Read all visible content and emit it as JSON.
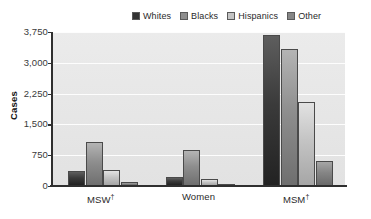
{
  "chart_data": {
    "type": "bar",
    "title": "",
    "xlabel": "",
    "ylabel": "Cases",
    "categories": [
      "MSW†",
      "Women",
      "MSM†"
    ],
    "series": [
      {
        "name": "Whites",
        "color": "#333333",
        "values": [
          370,
          230,
          3680
        ]
      },
      {
        "name": "Blacks",
        "color": "#8e8e8e",
        "values": [
          1080,
          880,
          3330
        ]
      },
      {
        "name": "Hispanics",
        "color": "#c4c4c4",
        "values": [
          380,
          180,
          2050
        ]
      },
      {
        "name": "Other",
        "color": "#868686",
        "values": [
          90,
          50,
          620
        ]
      }
    ],
    "ylim": [
      0,
      3750
    ],
    "yticks": [
      0,
      750,
      1500,
      2250,
      3000,
      3750
    ],
    "ytick_labels": [
      "0",
      "750",
      "1,500",
      "2,250",
      "3,000",
      "3,750"
    ],
    "grid": true,
    "grid_axis": "y",
    "legend_position": "top-right",
    "plot_background": "#e7e7e7"
  },
  "legend": {
    "items": [
      {
        "label": "Whites"
      },
      {
        "label": "Blacks"
      },
      {
        "label": "Hispanics"
      },
      {
        "label": "Other"
      }
    ]
  },
  "axes": {
    "y_title": "Cases",
    "y_labels": [
      "3,750",
      "3,000",
      "2,250",
      "1,500",
      "750",
      "0"
    ],
    "x_labels": [
      "MSW",
      "Women",
      "MSM"
    ],
    "x_label_markers": [
      "†",
      "",
      "†"
    ]
  },
  "source": {
    "note": "s for Disease Control and Prevention, 2014b."
  }
}
